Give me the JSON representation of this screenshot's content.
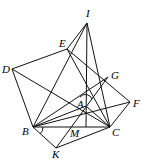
{
  "diagram": {
    "points": {
      "I": [
        87,
        23
      ],
      "E": [
        67,
        49
      ],
      "D": [
        12,
        69
      ],
      "G": [
        108,
        77
      ],
      "F": [
        130,
        102
      ],
      "A": [
        86,
        106
      ],
      "B": [
        33,
        127
      ],
      "C": [
        110,
        127
      ],
      "M": [
        86,
        127
      ],
      "K": [
        56,
        148
      ]
    },
    "labels": [
      {
        "text": "I",
        "x": 86,
        "y": 17
      },
      {
        "text": "E",
        "x": 59,
        "y": 47
      },
      {
        "text": "D",
        "x": 2,
        "y": 73
      },
      {
        "text": "G",
        "x": 111,
        "y": 79
      },
      {
        "text": "F",
        "x": 133,
        "y": 107
      },
      {
        "text": "A",
        "x": 77,
        "y": 108
      },
      {
        "text": "B",
        "x": 22,
        "y": 135
      },
      {
        "text": "M",
        "x": 70,
        "y": 137
      },
      {
        "text": "C",
        "x": 112,
        "y": 136
      },
      {
        "text": "K",
        "x": 52,
        "y": 158
      }
    ],
    "segments": [
      [
        "I",
        "E"
      ],
      [
        "I",
        "M"
      ],
      [
        "I",
        "C"
      ],
      [
        "I",
        "B"
      ],
      [
        "D",
        "E"
      ],
      [
        "D",
        "B"
      ],
      [
        "D",
        "C"
      ],
      [
        "E",
        "F"
      ],
      [
        "G",
        "B"
      ],
      [
        "F",
        "B"
      ],
      [
        "F",
        "C"
      ],
      [
        "B",
        "C"
      ],
      [
        "B",
        "K"
      ],
      [
        "K",
        "C"
      ],
      [
        "K",
        "G"
      ],
      [
        "E",
        "C"
      ],
      [
        "A",
        "B"
      ],
      [
        "A",
        "C"
      ]
    ]
  }
}
